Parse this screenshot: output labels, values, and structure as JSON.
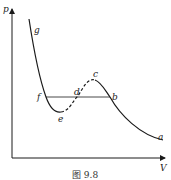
{
  "figure": {
    "caption": "图 9.8",
    "axes": {
      "y_label": "p",
      "x_label": "V"
    },
    "points": {
      "g": "g",
      "f": "f",
      "e": "e",
      "d": "d",
      "c": "c",
      "b": "b",
      "a": "a"
    },
    "line_color": "#1a1a1a"
  }
}
